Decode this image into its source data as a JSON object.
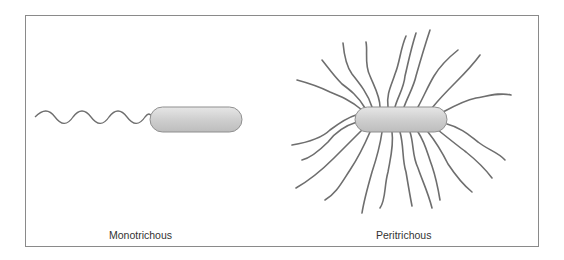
{
  "figure": {
    "panels": [
      {
        "id": "monotrichous",
        "label": "Monotrichous",
        "flagella_count": 1
      },
      {
        "id": "peritrichous",
        "label": "Peritrichous",
        "flagella_count": 22
      }
    ],
    "colors": {
      "frame": "#8a8a8a",
      "cell_fill": "#d4d4d4",
      "cell_stroke": "#8f8f8f",
      "flagellum": "#6e6e6e",
      "text": "#333333"
    }
  }
}
